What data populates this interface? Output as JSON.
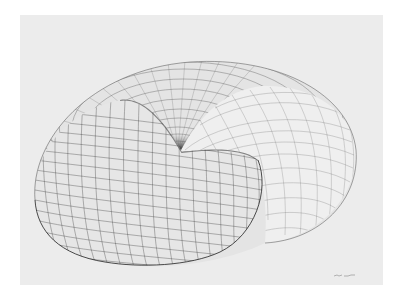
{
  "artwork": {
    "subject": "wireframe torus drawing",
    "background_color": "#ffffff",
    "paper_color": "#ececec",
    "line_color": "#3a3a3a",
    "signature": ""
  }
}
